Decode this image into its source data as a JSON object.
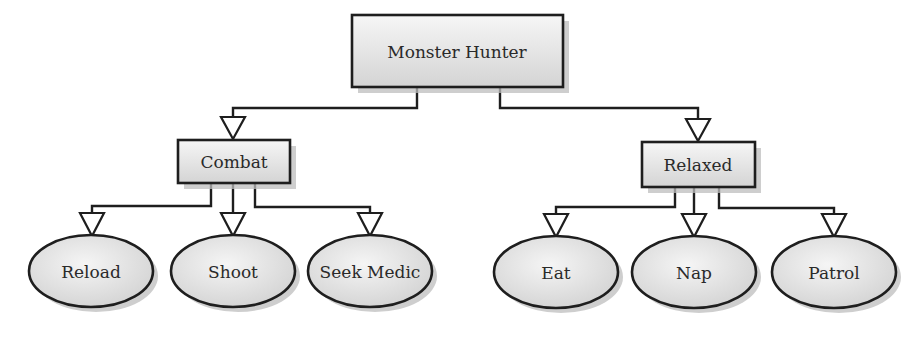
{
  "diagram": {
    "type": "hierarchy-tree",
    "root": {
      "label": "Monster Hunter"
    },
    "states": [
      {
        "label": "Combat",
        "children": [
          "Reload",
          "Shoot",
          "Seek Medic"
        ]
      },
      {
        "label": "Relaxed",
        "children": [
          "Eat",
          "Nap",
          "Patrol"
        ]
      }
    ],
    "nodes": {
      "root": "Monster Hunter",
      "combat": "Combat",
      "relaxed": "Relaxed",
      "reload": "Reload",
      "shoot": "Shoot",
      "seek_medic": "Seek Medic",
      "eat": "Eat",
      "nap": "Nap",
      "patrol": "Patrol"
    },
    "colors": {
      "stroke": "#1e1e1e",
      "fill_light": "#f4f4f4",
      "fill_dark": "#d2d2d2",
      "shadow": "#bdbdbd",
      "text": "#2a2a2a"
    }
  }
}
